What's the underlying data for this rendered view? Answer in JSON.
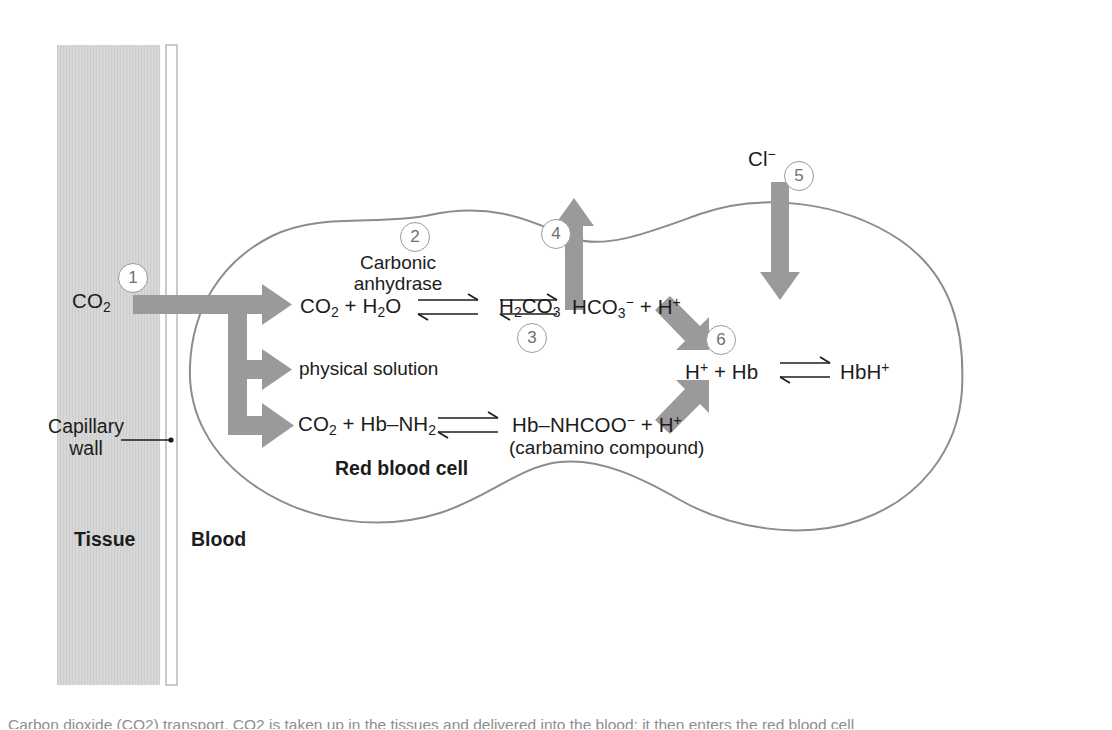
{
  "figure": {
    "compartments": {
      "tissue_label": "Tissue",
      "blood_label": "Blood",
      "capillary_wall_label_line1": "Capillary",
      "capillary_wall_label_line2": "wall",
      "cell_label": "Red blood cell"
    },
    "colors": {
      "arrow_gray": "#9a9a9a",
      "tissue_fill": "#d8d8d8",
      "tissue_stripe": "#c9c9c9",
      "outline_gray": "#8c8c8c",
      "marker_border": "#9b9b9b",
      "marker_text": "#6f6f6f",
      "text": "#1c1c1c"
    },
    "markers": [
      {
        "id": "1",
        "label": "1"
      },
      {
        "id": "2",
        "label": "2"
      },
      {
        "id": "3",
        "label": "3"
      },
      {
        "id": "4",
        "label": "4"
      },
      {
        "id": "5",
        "label": "5"
      },
      {
        "id": "6",
        "label": "6"
      }
    ],
    "species": {
      "co2_tissue": "CO2",
      "chloride": "Cl-"
    },
    "enzyme": {
      "line1": "Carbonic",
      "line2": "anhydrase"
    },
    "reactions": {
      "hydration_left": "CO2 + H2O",
      "hydration_mid": "H2CO3",
      "hydration_right": "HCO3- + H+",
      "physical_solution": "physical solution",
      "carbamino_left": "CO2 + Hb-NH2",
      "carbamino_right": "Hb-NHCOO- + H+",
      "carbamino_note": "(carbamino compound)",
      "buffer_left": "H+ + Hb",
      "buffer_right": "HbH+"
    },
    "caption": "Carbon dioxide (CO2) transport. CO2 is taken up in the tissues and delivered into the blood; it then enters the red blood cell"
  }
}
